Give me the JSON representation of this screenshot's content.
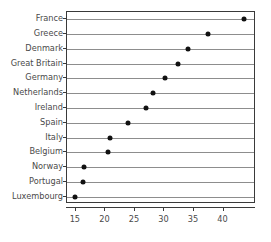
{
  "chart_data": {
    "type": "scatter",
    "subtype": "dot-plot",
    "title": "",
    "subtitle": "",
    "xlabel": "",
    "ylabel": "",
    "orientation": "horizontal",
    "grid": "horizontal-row-lines",
    "legend": "none",
    "xlim": [
      13.5,
      45.5
    ],
    "xticks": [
      15,
      20,
      25,
      30,
      35,
      40
    ],
    "xtick_labels": [
      "15",
      "20",
      "25",
      "30",
      "35",
      "40"
    ],
    "categories": [
      "France",
      "Greece",
      "Denmark",
      "Great Britain",
      "Germany",
      "Netherlands",
      "Ireland",
      "Spain",
      "Italy",
      "Belgium",
      "Norway",
      "Portugal",
      "Luxembourg"
    ],
    "values": [
      43.5,
      37.3,
      34.0,
      32.3,
      30.1,
      28.0,
      26.8,
      23.8,
      20.7,
      20.4,
      16.3,
      16.2,
      14.9
    ],
    "points": [
      {
        "category": "France",
        "value": 43.5
      },
      {
        "category": "Greece",
        "value": 37.3
      },
      {
        "category": "Denmark",
        "value": 34.0
      },
      {
        "category": "Great Britain",
        "value": 32.3
      },
      {
        "category": "Germany",
        "value": 30.1
      },
      {
        "category": "Netherlands",
        "value": 28.0
      },
      {
        "category": "Ireland",
        "value": 26.8
      },
      {
        "category": "Spain",
        "value": 23.8
      },
      {
        "category": "Italy",
        "value": 20.7
      },
      {
        "category": "Belgium",
        "value": 20.4
      },
      {
        "category": "Norway",
        "value": 16.3
      },
      {
        "category": "Portugal",
        "value": 16.2
      },
      {
        "category": "Luxembourg",
        "value": 14.9
      }
    ],
    "colors": {
      "marker": "#111111",
      "row_line": "#8d8d8d",
      "frame": "#3a3a3a",
      "text": "#4a4a4a",
      "background": "#ffffff"
    }
  }
}
